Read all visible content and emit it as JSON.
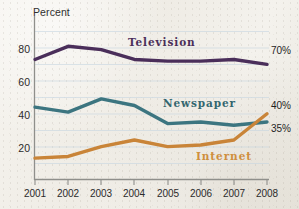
{
  "chart_data": {
    "type": "line",
    "title": "",
    "xlabel": "",
    "ylabel": "Percent",
    "categories": [
      "2001",
      "2002",
      "2003",
      "2004",
      "2005",
      "2006",
      "2007",
      "2008"
    ],
    "x": [
      2001,
      2002,
      2003,
      2004,
      2005,
      2006,
      2007,
      2008
    ],
    "ylim": [
      0,
      90
    ],
    "yticks": [
      20,
      40,
      60,
      80
    ],
    "ytick_labels": [
      "20",
      "40",
      "60",
      "80"
    ],
    "grid": "horizontal-minor-every-10",
    "legend_position": "inline-on-plot",
    "series": [
      {
        "name": "Television",
        "color": "#4a2e5a",
        "values": [
          73,
          81,
          79,
          73,
          72,
          72,
          73,
          70
        ],
        "end_label": "70%"
      },
      {
        "name": "Newspaper",
        "color": "#3c7580",
        "values": [
          44,
          41,
          49,
          45,
          34,
          35,
          33,
          35
        ],
        "end_label": "35%"
      },
      {
        "name": "Internet",
        "color": "#c98438",
        "values": [
          13,
          14,
          20,
          24,
          20,
          21,
          24,
          40
        ],
        "end_label": "40%"
      }
    ],
    "annotations": [
      "Internet overtakes Newspaper in 2008"
    ]
  },
  "axes": {
    "y_axis_title": "Percent",
    "y_tick_labels": [
      "80",
      "60",
      "40",
      "20"
    ],
    "x_tick_labels": [
      "2001",
      "2002",
      "2003",
      "2004",
      "2005",
      "2006",
      "2007",
      "2008"
    ]
  },
  "series_labels": {
    "television": "Television",
    "newspaper": "Newspaper",
    "internet": "Internet"
  },
  "end_labels": {
    "television": "70%",
    "newspaper": "35%",
    "internet": "40%"
  },
  "colors": {
    "television": "#4a2e5a",
    "newspaper": "#3c7580",
    "internet": "#c98438",
    "axis": "#8a8a86",
    "gridline": "#c9d8e2",
    "text": "#2b2b2b",
    "paper": "#f1eee8"
  }
}
